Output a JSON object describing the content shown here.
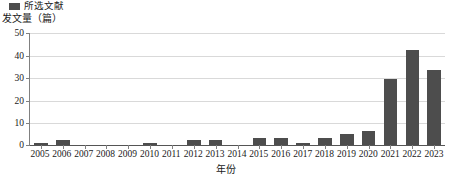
{
  "legend": {
    "position": "top-left",
    "entries": [
      {
        "label": "所选文献",
        "color": "#4d4d4d",
        "swatch_name": "legend-swatch-selected-literature"
      }
    ]
  },
  "axes": {
    "y_title": "发文量（篇）",
    "x_title": "年份",
    "y_ticks": [
      "50",
      "40",
      "30",
      "20",
      "10",
      "0"
    ]
  },
  "chart_data": {
    "type": "bar",
    "title": "",
    "subtitle": "",
    "xlabel": "年份",
    "ylabel": "发文量（篇）",
    "ylim": [
      0,
      50
    ],
    "yticks": [
      0,
      10,
      20,
      30,
      40,
      50
    ],
    "grid": true,
    "legend_position": "top-left",
    "series_name": "所选文献",
    "bar_color": "#4d4d4d",
    "categories": [
      "2005",
      "2006",
      "2007",
      "2008",
      "2009",
      "2010",
      "2011",
      "2012",
      "2013",
      "2014",
      "2015",
      "2016",
      "2017",
      "2018",
      "2019",
      "2020",
      "2021",
      "2022",
      "2023"
    ],
    "values": [
      1,
      2,
      0,
      0,
      0,
      1,
      0,
      2,
      2,
      0,
      3,
      3,
      1,
      3,
      5,
      6,
      29,
      42,
      33
    ],
    "series": [
      {
        "name": "所选文献",
        "color": "#4d4d4d",
        "values": [
          1,
          2,
          0,
          0,
          0,
          1,
          0,
          2,
          2,
          0,
          3,
          3,
          1,
          3,
          5,
          6,
          29,
          42,
          33
        ]
      }
    ]
  }
}
